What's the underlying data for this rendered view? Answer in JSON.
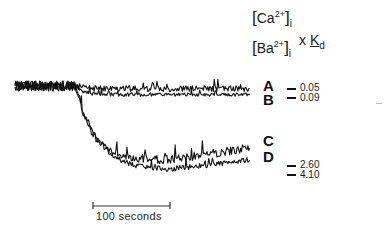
{
  "chart_data": {
    "type": "line",
    "title": "",
    "header": {
      "numerator": {
        "ion": "Ca",
        "charge": "2+",
        "subscript": "i"
      },
      "denominator": {
        "ion": "Ba",
        "charge": "2+",
        "subscript": "i"
      },
      "multiplier_symbol": "x",
      "constant": "K",
      "constant_subscript": "d"
    },
    "xlabel": "",
    "ylabel": "",
    "scale_bar": {
      "label": "100 seconds",
      "duration_s": 100
    },
    "x_range_s": [
      0,
      310
    ],
    "stimulus_time_s": 80,
    "baseline": 0,
    "series": [
      {
        "name": "A",
        "ratio": "0.05",
        "plateau": -0.03,
        "noise": 0.035,
        "tau_s": 10,
        "recovery": 0.0
      },
      {
        "name": "B",
        "ratio": "0.09",
        "plateau": -0.1,
        "noise": 0.02,
        "tau_s": 10,
        "recovery": 0.0
      },
      {
        "name": "C",
        "ratio": "2.60",
        "plateau": -0.86,
        "noise": 0.05,
        "tau_s": 22,
        "recovery": 0.14
      },
      {
        "name": "D",
        "ratio": "4.10",
        "plateau": -0.98,
        "noise": 0.03,
        "tau_s": 28,
        "recovery": 0.12
      }
    ],
    "y_range": [
      -1.2,
      0.3
    ],
    "grid": false,
    "legend": "right"
  }
}
